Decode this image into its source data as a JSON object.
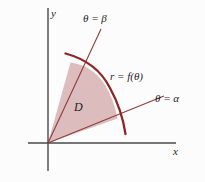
{
  "figure": {
    "background_color": "#fdfcfc",
    "axes": {
      "x_label": "x",
      "y_label": "y",
      "axis_color": "#4a4a4a",
      "origin": {
        "x": 48,
        "y": 143
      },
      "x_axis": {
        "x1": 28,
        "y1": 143,
        "x2": 176,
        "y2": 143
      },
      "y_axis": {
        "x1": 48,
        "y1": 8,
        "x2": 48,
        "y2": 171
      }
    },
    "labels": {
      "theta_beta": "θ = β",
      "theta_alpha": "θ = α",
      "curve": "r = f(θ)",
      "region": "D"
    },
    "colors": {
      "region_fill": "#dcbcbd",
      "region_edge": "#8f3a39",
      "curve_stroke": "#8b2724",
      "ray_stroke": "#8f3a39",
      "axis": "#4a4a4a",
      "text": "#1d1d1d"
    },
    "geometry": {
      "ray_beta": {
        "x1": 48,
        "y1": 143,
        "x2": 101,
        "y2": 29
      },
      "ray_alpha": {
        "x1": 48,
        "y1": 143,
        "x2": 164,
        "y2": 96
      },
      "curve_arc": "M 66,54 Q 112,70 125,134",
      "region_path": "M 48,143 L 71,63 Q 104,72 117,118 Z"
    }
  }
}
